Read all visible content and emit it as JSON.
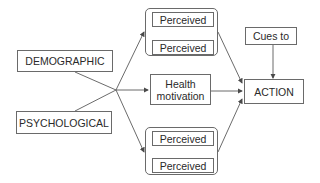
{
  "diagram": {
    "type": "flow",
    "nodes": {
      "demographic": "DEMOGRAPHIC",
      "psychological": "PSYCHOLOGICAL",
      "perceived_top_1": "Perceived",
      "perceived_top_2": "Perceived",
      "health_motivation": "Health motivation",
      "perceived_bottom_1": "Perceived",
      "perceived_bottom_2": "Perceived",
      "cues_to": "Cues to",
      "action": "ACTION"
    },
    "edges": [
      {
        "from": "demographic",
        "to": "junction"
      },
      {
        "from": "psychological",
        "to": "junction"
      },
      {
        "from": "junction",
        "to": "perceived_top_group"
      },
      {
        "from": "junction",
        "to": "health_motivation"
      },
      {
        "from": "junction",
        "to": "perceived_bottom_group"
      },
      {
        "from": "perceived_top_group",
        "to": "action"
      },
      {
        "from": "health_motivation",
        "to": "action"
      },
      {
        "from": "perceived_bottom_group",
        "to": "action"
      },
      {
        "from": "cues_to",
        "to": "action"
      }
    ],
    "colors": {
      "line": "#5a5a5a",
      "text": "#2a2a2a",
      "background": "#ffffff"
    }
  }
}
